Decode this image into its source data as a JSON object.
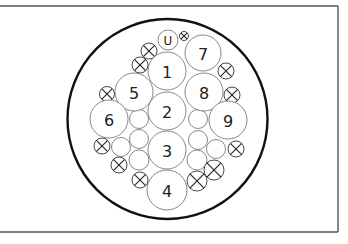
{
  "diagram": {
    "type": "connector-pin-layout",
    "colors": {
      "outline": "#111111",
      "contact_stroke": "#6a6a6a",
      "frame": "#555555",
      "background": "#ffffff"
    },
    "frame": {
      "top_y": 6,
      "right_x": 338,
      "bottom_y": 232,
      "left_open": true
    },
    "outer_circle": {
      "cx": 167.5,
      "cy": 119,
      "r": 100
    },
    "contacts": [
      {
        "label": "U",
        "cx": 168,
        "cy": 40,
        "r": 10,
        "small": true
      },
      {
        "label": "7",
        "cx": 203,
        "cy": 53,
        "r": 18
      },
      {
        "label": "1",
        "cx": 167,
        "cy": 71,
        "r": 19
      },
      {
        "label": "5",
        "cx": 134,
        "cy": 92,
        "r": 19
      },
      {
        "label": "8",
        "cx": 204,
        "cy": 92,
        "r": 19
      },
      {
        "label": "2",
        "cx": 167,
        "cy": 111,
        "r": 19
      },
      {
        "label": "6",
        "cx": 109,
        "cy": 119,
        "r": 19
      },
      {
        "label": "9",
        "cx": 228,
        "cy": 120,
        "r": 19
      },
      {
        "label": "3",
        "cx": 167,
        "cy": 150,
        "r": 19
      },
      {
        "label": "4",
        "cx": 167,
        "cy": 190,
        "r": 20
      }
    ],
    "filler_circles": [
      {
        "cx": 139,
        "cy": 119,
        "r": 9.5
      },
      {
        "cx": 139,
        "cy": 139,
        "r": 9.5
      },
      {
        "cx": 121,
        "cy": 147,
        "r": 9.5
      },
      {
        "cx": 139,
        "cy": 160,
        "r": 10
      },
      {
        "cx": 198,
        "cy": 119,
        "r": 9.5
      },
      {
        "cx": 198,
        "cy": 140,
        "r": 9.5
      },
      {
        "cx": 216,
        "cy": 149,
        "r": 9.5
      },
      {
        "cx": 197,
        "cy": 160,
        "r": 10
      }
    ],
    "blind_plugs": [
      {
        "cx": 184,
        "cy": 36,
        "r": 4.5
      },
      {
        "cx": 149,
        "cy": 51,
        "r": 8
      },
      {
        "cx": 140,
        "cy": 65,
        "r": 8
      },
      {
        "cx": 226,
        "cy": 71,
        "r": 8
      },
      {
        "cx": 107,
        "cy": 94,
        "r": 7.5
      },
      {
        "cx": 232,
        "cy": 95,
        "r": 8
      },
      {
        "cx": 102,
        "cy": 146,
        "r": 8
      },
      {
        "cx": 236,
        "cy": 149,
        "r": 8
      },
      {
        "cx": 119,
        "cy": 165,
        "r": 8
      },
      {
        "cx": 214,
        "cy": 170,
        "r": 10
      },
      {
        "cx": 140,
        "cy": 180,
        "r": 8
      },
      {
        "cx": 197,
        "cy": 181,
        "r": 10
      }
    ]
  }
}
